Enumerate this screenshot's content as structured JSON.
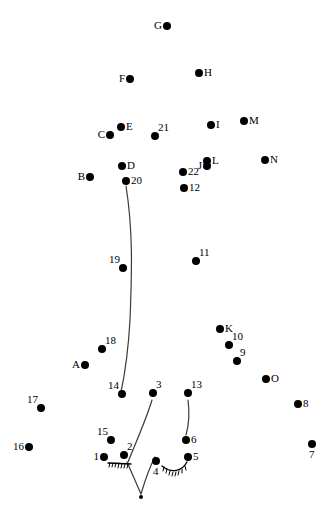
{
  "figure": {
    "width": 334,
    "height": 518,
    "background_color": "#ffffff",
    "ink_color": "#000000",
    "dot_radius": 4,
    "small_dot_radius": 2
  },
  "points": [
    {
      "id": "G",
      "label": "G",
      "x": 167,
      "y": 26,
      "label_pos": "lab-left",
      "r": 4
    },
    {
      "id": "F",
      "label": "F",
      "x": 130,
      "y": 79,
      "label_pos": "lab-left",
      "r": 4
    },
    {
      "id": "H",
      "label": "H",
      "x": 199,
      "y": 73,
      "label_pos": "lab-right",
      "r": 4
    },
    {
      "id": "I",
      "label": "I",
      "x": 211,
      "y": 125,
      "label_pos": "lab-right",
      "r": 4
    },
    {
      "id": "M",
      "label": "M",
      "x": 244,
      "y": 121,
      "label_pos": "lab-right",
      "r": 4
    },
    {
      "id": "E",
      "label": "E",
      "x": 121,
      "y": 127,
      "label_pos": "lab-right",
      "r": 4
    },
    {
      "id": "C",
      "label": "C",
      "x": 110,
      "y": 135,
      "label_pos": "lab-left",
      "r": 4
    },
    {
      "id": "21",
      "label": "21",
      "x": 155,
      "y": 136,
      "label_pos": "lab-tr",
      "r": 4
    },
    {
      "id": "L",
      "label": "L",
      "x": 207,
      "y": 161,
      "label_pos": "lab-right",
      "r": 4
    },
    {
      "id": "J",
      "label": "J",
      "x": 207,
      "y": 166,
      "label_pos": "lab-left",
      "r": 4
    },
    {
      "id": "N",
      "label": "N",
      "x": 265,
      "y": 160,
      "label_pos": "lab-right",
      "r": 4
    },
    {
      "id": "D",
      "label": "D",
      "x": 122,
      "y": 166,
      "label_pos": "lab-right",
      "r": 4
    },
    {
      "id": "B",
      "label": "B",
      "x": 90,
      "y": 177,
      "label_pos": "lab-left",
      "r": 4
    },
    {
      "id": "20",
      "label": "20",
      "x": 126,
      "y": 181,
      "label_pos": "lab-right",
      "r": 4
    },
    {
      "id": "22",
      "label": "22",
      "x": 183,
      "y": 172,
      "label_pos": "lab-right",
      "r": 4
    },
    {
      "id": "12",
      "label": "12",
      "x": 184,
      "y": 188,
      "label_pos": "lab-right",
      "r": 4
    },
    {
      "id": "11",
      "label": "11",
      "x": 196,
      "y": 261,
      "label_pos": "lab-tr",
      "r": 4
    },
    {
      "id": "19",
      "label": "19",
      "x": 123,
      "y": 268,
      "label_pos": "lab-tl",
      "r": 4
    },
    {
      "id": "K",
      "label": "K",
      "x": 220,
      "y": 329,
      "label_pos": "lab-right",
      "r": 4
    },
    {
      "id": "10",
      "label": "10",
      "x": 229,
      "y": 345,
      "label_pos": "lab-tr",
      "r": 4
    },
    {
      "id": "9",
      "label": "9",
      "x": 237,
      "y": 361,
      "label_pos": "lab-tr",
      "r": 4
    },
    {
      "id": "18",
      "label": "18",
      "x": 102,
      "y": 349,
      "label_pos": "lab-tr",
      "r": 4
    },
    {
      "id": "A",
      "label": "A",
      "x": 85,
      "y": 365,
      "label_pos": "lab-left",
      "r": 4
    },
    {
      "id": "O",
      "label": "O",
      "x": 266,
      "y": 379,
      "label_pos": "lab-right",
      "r": 4
    },
    {
      "id": "14",
      "label": "14",
      "x": 122,
      "y": 394,
      "label_pos": "lab-tl",
      "r": 4
    },
    {
      "id": "3",
      "label": "3",
      "x": 153,
      "y": 393,
      "label_pos": "lab-tr",
      "r": 4
    },
    {
      "id": "13",
      "label": "13",
      "x": 188,
      "y": 393,
      "label_pos": "lab-tr",
      "r": 4
    },
    {
      "id": "8",
      "label": "8",
      "x": 298,
      "y": 404,
      "label_pos": "lab-right",
      "r": 4
    },
    {
      "id": "17",
      "label": "17",
      "x": 41,
      "y": 408,
      "label_pos": "lab-tl",
      "r": 4
    },
    {
      "id": "7",
      "label": "7",
      "x": 312,
      "y": 444,
      "label_pos": "lab-below",
      "r": 4
    },
    {
      "id": "16",
      "label": "16",
      "x": 29,
      "y": 447,
      "label_pos": "lab-left",
      "r": 4
    },
    {
      "id": "15",
      "label": "15",
      "x": 111,
      "y": 440,
      "label_pos": "lab-tl",
      "r": 4
    },
    {
      "id": "6",
      "label": "6",
      "x": 186,
      "y": 440,
      "label_pos": "lab-right",
      "r": 4
    },
    {
      "id": "2",
      "label": "2",
      "x": 124,
      "y": 455,
      "label_pos": "lab-tr",
      "r": 4
    },
    {
      "id": "1",
      "label": "1",
      "x": 104,
      "y": 457,
      "label_pos": "lab-left",
      "r": 4
    },
    {
      "id": "5",
      "label": "5",
      "x": 188,
      "y": 457,
      "label_pos": "lab-right",
      "r": 4
    },
    {
      "id": "4",
      "label": "4",
      "x": 156,
      "y": 461,
      "label_pos": "lab-below",
      "r": 4
    },
    {
      "id": "vertex",
      "label": "",
      "x": 141,
      "y": 497,
      "label_pos": "lab-below",
      "r": 2
    }
  ],
  "strokes": {
    "spine_curve": "M126,186 C133,230 132,270 130,320 C128,355 124,378 121,392",
    "line_3_to_2": "M152,400 C146,420 136,442 128,462",
    "line_2_to_vertex": "M127,462 L141,494",
    "line_13_to_6": "M188,400 C190,415 188,428 186,435",
    "curve_4_to_vertex": "M155,457 C148,470 144,484 141,494",
    "hatch_arc_left": "M108,463 L131,464",
    "hatch_arc_right": "M162,466 C172,474 182,471 187,462",
    "hatch_left_ticks": [
      "M110,463 L109,467",
      "M113,463 L112,467",
      "M116,463 L115,467",
      "M119,463 L118,468",
      "M122,464 L121,468",
      "M125,464 L124,468",
      "M128,464 L127,468"
    ],
    "hatch_right_ticks": [
      "M164,467 L163,471",
      "M167,469 L166,473",
      "M170,471 L169,475",
      "M173,472 L172,476",
      "M176,472 L175,476",
      "M179,471 L178,475",
      "M182,469 L182,473",
      "M185,466 L186,470"
    ]
  }
}
